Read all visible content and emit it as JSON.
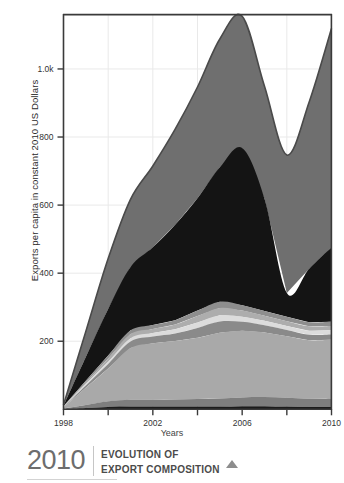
{
  "footer": {
    "year": "2010",
    "title_line1": "EVOLUTION OF",
    "title_line2": "EXPORT COMPOSITION",
    "marker_icon": "triangle-up-icon"
  },
  "colors": {
    "background": "#ffffff",
    "axis": "#3a3a3a",
    "grid": "#e9e9e9",
    "band_1": "#6f6f6f",
    "band_2": "#141414",
    "band_3": "#8e8e8e",
    "band_4": "#adadad",
    "band_5": "#dcdcdc",
    "band_6": "#8a8a8a",
    "band_7": "#a9a9a9",
    "band_8": "#7e7e7e",
    "band_9": "#1b1b1b",
    "band_top_outline": "#4a4a4a",
    "text": "#333333",
    "footer_year": "#6d6d6d",
    "footer_title": "#4b4b4b",
    "footer_marker": "#8d8d8d"
  },
  "chart_data": {
    "type": "area",
    "stacked": true,
    "title": "EVOLUTION OF EXPORT COMPOSITION",
    "xlabel": "Years",
    "ylabel": "Exports per capita in constant 2010 US Dollars",
    "xlim": [
      1998,
      2010
    ],
    "ylim": [
      0,
      1160
    ],
    "grid": true,
    "legend": "none",
    "x": [
      1998,
      1999,
      2000,
      2001,
      2002,
      2003,
      2004,
      2005,
      2006,
      2007,
      2008,
      2009,
      2010
    ],
    "xticks": [
      1998,
      2000,
      2002,
      2004,
      2006,
      2008,
      2010
    ],
    "xtick_labels": [
      "1998",
      "",
      "2002",
      "",
      "2006",
      "",
      "2010"
    ],
    "yticks": [
      200,
      400,
      600,
      800,
      1000
    ],
    "ytick_labels": [
      "200",
      "400",
      "600",
      "800",
      "1.0k"
    ],
    "series": [
      {
        "name": "series-1-base-dark",
        "color": "#1b1b1b",
        "values": [
          1,
          4,
          7,
          8,
          8,
          8,
          8,
          8,
          9,
          9,
          8,
          7,
          7
        ]
      },
      {
        "name": "series-2-lower-mid-grey",
        "color": "#7e7e7e",
        "values": [
          1,
          9,
          17,
          20,
          20,
          21,
          22,
          24,
          26,
          27,
          26,
          24,
          25
        ]
      },
      {
        "name": "series-3-light-grey-major",
        "color": "#a9a9a9",
        "values": [
          3,
          50,
          96,
          152,
          166,
          172,
          180,
          193,
          196,
          190,
          181,
          172,
          172
        ]
      },
      {
        "name": "series-4-mid-grey-thin",
        "color": "#8a8a8a",
        "values": [
          1,
          7,
          13,
          19,
          20,
          22,
          29,
          33,
          26,
          21,
          18,
          16,
          16
        ]
      },
      {
        "name": "series-5-pale-band",
        "color": "#dcdcdc",
        "values": [
          1,
          4,
          7,
          10,
          10,
          12,
          16,
          18,
          15,
          13,
          12,
          12,
          12
        ]
      },
      {
        "name": "series-6-grey-band",
        "color": "#adadad",
        "values": [
          1,
          5,
          9,
          12,
          12,
          14,
          19,
          22,
          18,
          15,
          14,
          13,
          13
        ]
      },
      {
        "name": "series-7-steel-grey",
        "color": "#8e8e8e",
        "values": [
          1,
          5,
          9,
          11,
          12,
          13,
          16,
          18,
          16,
          14,
          13,
          12,
          12
        ]
      },
      {
        "name": "series-8-dark-major",
        "color": "#141414",
        "values": [
          2,
          70,
          137,
          186,
          228,
          280,
          330,
          395,
          462,
          330,
          70,
          157,
          219
        ]
      },
      {
        "name": "series-9-top-grey",
        "color": "#6f6f6f",
        "values": [
          2,
          75,
          148,
          199,
          239,
          281,
          327,
          377,
          387,
          330,
          405,
          490,
          643
        ]
      }
    ],
    "totals": [
      13,
      229,
      443,
      617,
      715,
      823,
      947,
      1088,
      1155,
      949,
      747,
      903,
      1119
    ],
    "annotations": []
  }
}
